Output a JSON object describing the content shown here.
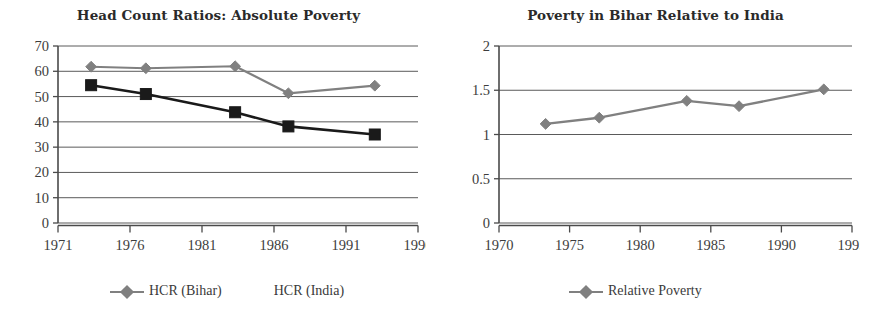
{
  "figure": {
    "background": "#ffffff",
    "panels": [
      "left",
      "right"
    ]
  },
  "left": {
    "title": "Head Count Ratios: Absolute Poverty",
    "legend": [
      {
        "label": "HCR (Bihar)",
        "marker": "diamond-icon",
        "color": "#808080",
        "has_line": true
      },
      {
        "label": "HCR (India)",
        "marker": "none",
        "color": "#1a1a1a",
        "has_line": false
      }
    ]
  },
  "right": {
    "title": "Poverty in Bihar Relative to India",
    "legend": [
      {
        "label": "Relative Poverty",
        "marker": "diamond-icon",
        "color": "#808080",
        "has_line": true
      }
    ]
  },
  "chart_data": [
    {
      "type": "line",
      "title": "Head Count Ratios: Absolute Poverty",
      "xlabel": "",
      "ylabel": "",
      "xlim": [
        1971,
        1996
      ],
      "ylim": [
        0,
        70
      ],
      "xticks": [
        1971,
        1976,
        1981,
        1986,
        1991,
        1996
      ],
      "yticks": [
        0,
        10,
        20,
        30,
        40,
        50,
        60,
        70
      ],
      "xticklabels": [
        "1971",
        "1976",
        "1981",
        "1986",
        "1991",
        "1996"
      ],
      "yticklabels": [
        "0",
        "10",
        "20",
        "30",
        "40",
        "50",
        "60",
        "70"
      ],
      "grid": "horizontal",
      "legend_position": "below",
      "x": [
        1973.3,
        1977.1,
        1983.3,
        1987.0,
        1993.0
      ],
      "series": [
        {
          "name": "HCR (Bihar)",
          "values": [
            61.8,
            61.2,
            62.0,
            51.3,
            54.3
          ],
          "color": "#808080",
          "marker": "diamond",
          "linewidth": 2.2
        },
        {
          "name": "HCR (India)",
          "values": [
            54.5,
            51.0,
            43.8,
            38.2,
            35.0
          ],
          "color": "#1a1a1a",
          "marker": "square",
          "linewidth": 2.6
        }
      ]
    },
    {
      "type": "line",
      "title": "Poverty in Bihar Relative to India",
      "xlabel": "",
      "ylabel": "",
      "xlim": [
        1970,
        1995
      ],
      "ylim": [
        0,
        2
      ],
      "xticks": [
        1970,
        1975,
        1980,
        1985,
        1990,
        1995
      ],
      "yticks": [
        0,
        0.5,
        1,
        1.5,
        2
      ],
      "xticklabels": [
        "1970",
        "1975",
        "1980",
        "1985",
        "1990",
        "1995"
      ],
      "yticklabels": [
        "0",
        "0.5",
        "1",
        "1.5",
        "2"
      ],
      "grid": "horizontal",
      "legend_position": "below",
      "x": [
        1973.3,
        1977.1,
        1983.3,
        1987.0,
        1993.0
      ],
      "series": [
        {
          "name": "Relative Poverty",
          "values": [
            1.12,
            1.19,
            1.38,
            1.32,
            1.51
          ],
          "color": "#808080",
          "marker": "diamond",
          "linewidth": 2.4
        }
      ]
    }
  ]
}
